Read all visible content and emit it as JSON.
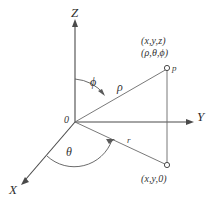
{
  "figure": {
    "kind": "spherical-coordinate-axes-diagram",
    "background_color": "#ffffff",
    "line_color": "#4a4a4a",
    "text_color": "#333333"
  },
  "axes": {
    "z_label": "Z",
    "y_label": "Y",
    "x_label": "X",
    "origin_label": "0"
  },
  "angles": {
    "phi_label": "ϕ",
    "theta_label": "θ"
  },
  "segments": {
    "rho_label": "ρ",
    "r_label": "r"
  },
  "points": {
    "p_marker_label": "p",
    "p_cartesian_label": "(x,y,z)",
    "p_spherical_label": "(ρ,θ,ϕ)",
    "projection_label": "(x,y,0)"
  }
}
